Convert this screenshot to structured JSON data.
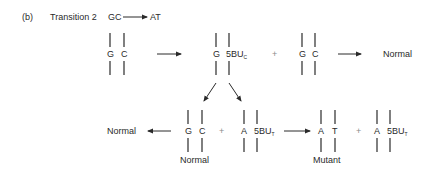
{
  "header": {
    "panel_label": "(b)",
    "title": "Transition 2",
    "from_pair": "GC",
    "to_pair": "AT"
  },
  "row1": {
    "start_pair": {
      "left": "G",
      "right": "C"
    },
    "intermediate_pair": {
      "left": "G",
      "right": "5BU",
      "right_subscript": "C"
    },
    "plus": "+",
    "daughter_pair": {
      "left": "G",
      "right": "C"
    },
    "result_label": "Normal"
  },
  "row2": {
    "left_result_label": "Normal",
    "pair1": {
      "left": "G",
      "right": "C",
      "caption": "Normal"
    },
    "plus1": "+",
    "pair2": {
      "left": "A",
      "right": "5BU",
      "right_subscript": "T"
    },
    "pair3": {
      "left": "A",
      "right": "T",
      "caption": "Mutant"
    },
    "plus2": "+",
    "pair4": {
      "left": "A",
      "right": "5BU",
      "right_subscript": "T"
    }
  },
  "colors": {
    "ink": "#2a2a2a",
    "plus": "#8a8a8a"
  }
}
